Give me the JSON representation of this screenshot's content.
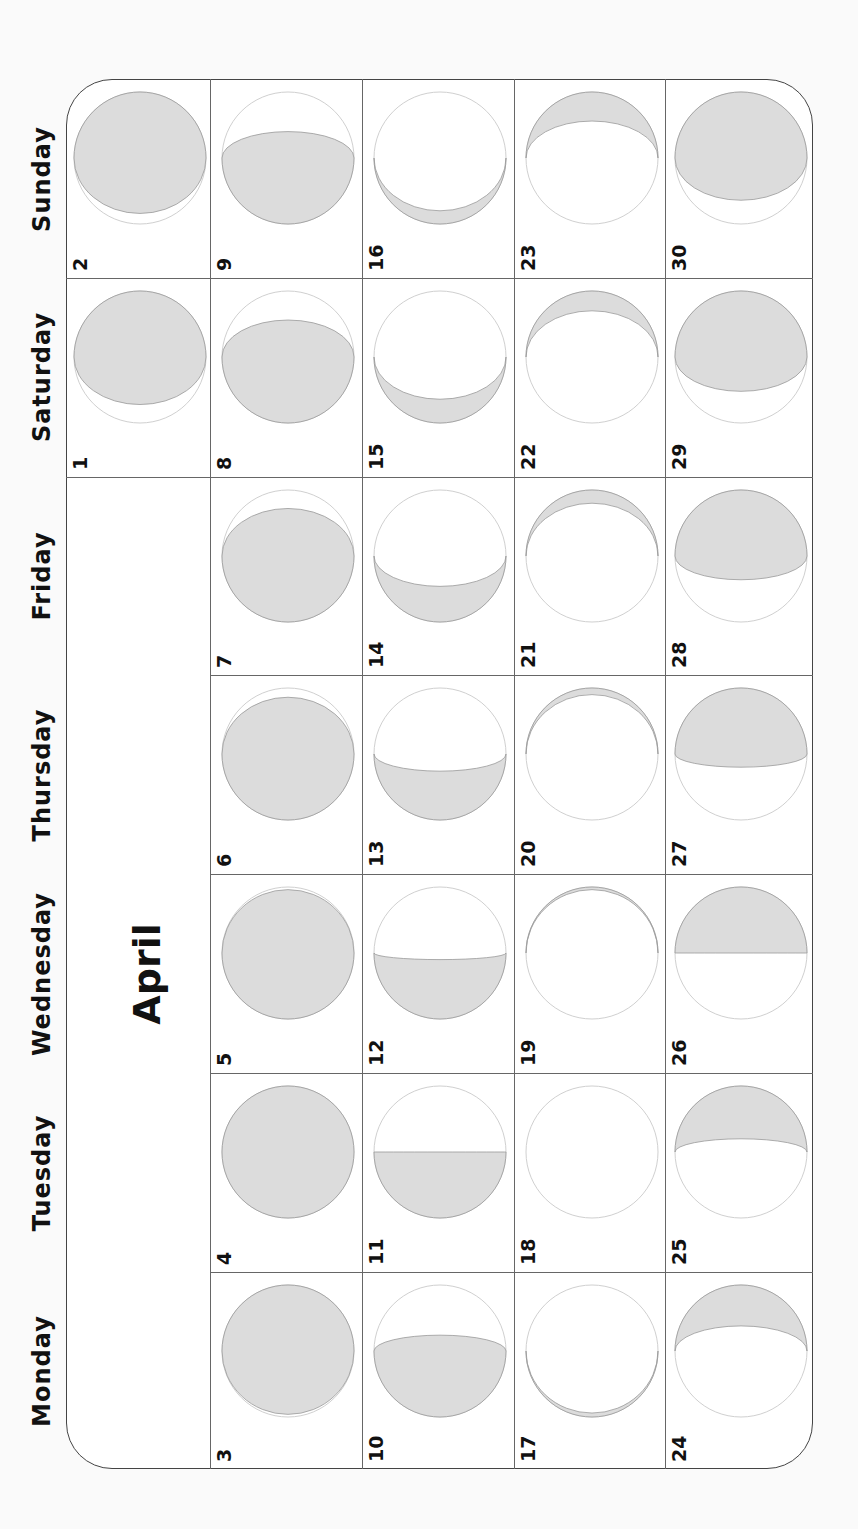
{
  "calendar": {
    "month": "April",
    "orientation": "rotated -90deg",
    "colors": {
      "moon_fill": "#dcdcdc",
      "moon_stroke": "#999999",
      "outline": "#d0d0d0",
      "grid": "#666666",
      "text": "#111111"
    },
    "weekdays": [
      "Sunday",
      "Saturday",
      "Friday",
      "Thursday",
      "Wednesday",
      "Tuesday",
      "Monday"
    ],
    "weeks": [
      {
        "days": [
          {
            "day": "2",
            "lit": 0.92,
            "side": "top"
          },
          {
            "day": "1",
            "lit": 0.86,
            "side": "top"
          },
          null,
          null,
          null,
          null,
          null
        ]
      },
      {
        "days": [
          {
            "day": "9",
            "lit": 0.7,
            "side": "bottom"
          },
          {
            "day": "8",
            "lit": 0.78,
            "side": "bottom"
          },
          {
            "day": "7",
            "lit": 0.86,
            "side": "bottom"
          },
          {
            "day": "6",
            "lit": 0.93,
            "side": "bottom"
          },
          {
            "day": "5",
            "lit": 0.98,
            "side": "bottom"
          },
          {
            "day": "4",
            "lit": 1.0,
            "side": "bottom"
          },
          {
            "day": "3",
            "lit": 0.98,
            "side": "top"
          }
        ]
      },
      {
        "days": [
          {
            "day": "16",
            "lit": 0.1,
            "side": "bottom"
          },
          {
            "day": "15",
            "lit": 0.18,
            "side": "bottom"
          },
          {
            "day": "14",
            "lit": 0.27,
            "side": "bottom"
          },
          {
            "day": "13",
            "lit": 0.37,
            "side": "bottom"
          },
          {
            "day": "12",
            "lit": 0.45,
            "side": "bottom"
          },
          {
            "day": "11",
            "lit": 0.5,
            "side": "bottom"
          },
          {
            "day": "10",
            "lit": 0.62,
            "side": "bottom"
          }
        ]
      },
      {
        "days": [
          {
            "day": "23",
            "lit": 0.22,
            "side": "top"
          },
          {
            "day": "22",
            "lit": 0.15,
            "side": "top"
          },
          {
            "day": "21",
            "lit": 0.1,
            "side": "top"
          },
          {
            "day": "20",
            "lit": 0.05,
            "side": "top"
          },
          {
            "day": "19",
            "lit": 0.02,
            "side": "top"
          },
          {
            "day": "18",
            "lit": 0.0,
            "side": "top"
          },
          {
            "day": "17",
            "lit": 0.03,
            "side": "bottom"
          }
        ]
      },
      {
        "days": [
          {
            "day": "30",
            "lit": 0.82,
            "side": "top"
          },
          {
            "day": "29",
            "lit": 0.76,
            "side": "top"
          },
          {
            "day": "28",
            "lit": 0.68,
            "side": "top"
          },
          {
            "day": "27",
            "lit": 0.6,
            "side": "top"
          },
          {
            "day": "26",
            "lit": 0.5,
            "side": "top"
          },
          {
            "day": "25",
            "lit": 0.4,
            "side": "top"
          },
          {
            "day": "24",
            "lit": 0.31,
            "side": "top"
          }
        ]
      }
    ]
  }
}
